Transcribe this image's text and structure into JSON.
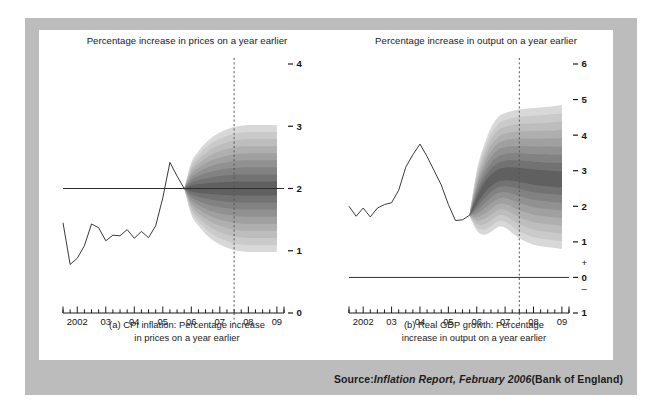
{
  "figure": {
    "background_color": "#ffffff",
    "frame_color": "#bcbcbc",
    "panel_color": "#ffffff",
    "ink_color": "#1a1a1a"
  },
  "source": {
    "prefix": "Source: ",
    "italic_part": "Inflation Report, February 2006",
    "suffix": " (Bank of England)"
  },
  "chart_data": [
    {
      "id": "cpi-inflation",
      "type": "area",
      "title": "Percentage increase in prices on a year earlier",
      "caption_line1": "(a)  CPI inflation: Percentage increase",
      "caption_line2": "in prices on a year earlier",
      "xlabel": "",
      "ylabel": "",
      "ylim": [
        0,
        4
      ],
      "yticks": [
        0,
        1,
        2,
        3,
        4
      ],
      "ytick_labels": [
        "0",
        "1",
        "2",
        "3",
        "4"
      ],
      "xlim": [
        2001.5,
        2009.25
      ],
      "xticks": [
        2002,
        2003,
        2004,
        2005,
        2006,
        2007,
        2008,
        2009
      ],
      "xtick_labels": [
        "2002",
        "03",
        "04",
        "05",
        "06",
        "07",
        "08",
        "09"
      ],
      "minor_tick_interval": 0.25,
      "grid": false,
      "target_line": {
        "value": 2.0,
        "label": "inflation target"
      },
      "forecast_start": 2005.75,
      "vertical_marker": {
        "x": 2007.5,
        "style": "dashed"
      },
      "history": {
        "x": [
          2001.5,
          2001.75,
          2002.0,
          2002.25,
          2002.5,
          2002.75,
          2003.0,
          2003.25,
          2003.5,
          2003.75,
          2004.0,
          2004.25,
          2004.5,
          2004.75,
          2005.0,
          2005.25,
          2005.5,
          2005.75
        ],
        "y": [
          1.45,
          0.78,
          0.88,
          1.08,
          1.43,
          1.37,
          1.16,
          1.25,
          1.24,
          1.34,
          1.2,
          1.31,
          1.21,
          1.4,
          1.85,
          2.42,
          2.2,
          2.0
        ]
      },
      "fan": {
        "center": {
          "x": [
            2005.75,
            2006.0,
            2006.25,
            2006.5,
            2006.75,
            2007.0,
            2007.25,
            2007.5,
            2007.75,
            2008.0,
            2008.25,
            2008.5,
            2008.75,
            2009.0
          ],
          "y": [
            2.0,
            2.0,
            2.0,
            2.0,
            2.0,
            2.0,
            2.0,
            2.0,
            2.0,
            2.0,
            2.0,
            2.0,
            2.0,
            2.0
          ]
        },
        "upper_outer": {
          "x": [
            2005.75,
            2006.0,
            2006.25,
            2006.5,
            2006.75,
            2007.0,
            2007.25,
            2007.5,
            2007.75,
            2008.0,
            2008.25,
            2008.5,
            2008.75,
            2009.0
          ],
          "y": [
            2.0,
            2.42,
            2.6,
            2.73,
            2.83,
            2.9,
            2.95,
            2.99,
            3.01,
            3.02,
            3.02,
            3.02,
            3.02,
            3.02
          ]
        },
        "lower_outer": {
          "x": [
            2005.75,
            2006.0,
            2006.25,
            2006.5,
            2006.75,
            2007.0,
            2007.25,
            2007.5,
            2007.75,
            2008.0,
            2008.25,
            2008.5,
            2008.75,
            2009.0
          ],
          "y": [
            2.0,
            1.58,
            1.4,
            1.27,
            1.17,
            1.1,
            1.05,
            1.01,
            0.99,
            0.98,
            0.98,
            0.98,
            0.98,
            0.98
          ]
        },
        "bands": 9,
        "shade_darkest": "#4a4a4a",
        "shade_lightest": "#d8d8d8"
      }
    },
    {
      "id": "real-gdp-growth",
      "type": "area",
      "title": "Percentage increase in output on a year earlier",
      "caption_line1": "(b)  Real GDP growth: Percentage",
      "caption_line2": "increase in output on a year earlier",
      "xlabel": "",
      "ylabel": "",
      "ylim": [
        -1,
        6
      ],
      "yticks": [
        -1,
        0,
        1,
        2,
        3,
        4,
        5,
        6
      ],
      "ytick_labels": [
        "1",
        "0",
        "1",
        "2",
        "3",
        "4",
        "5",
        "6"
      ],
      "sign_labels": {
        "plus": "+",
        "minus": "–"
      },
      "xlim": [
        2001.5,
        2009.25
      ],
      "xticks": [
        2002,
        2003,
        2004,
        2005,
        2006,
        2007,
        2008,
        2009
      ],
      "xtick_labels": [
        "2002",
        "03",
        "04",
        "05",
        "06",
        "07",
        "08",
        "09"
      ],
      "minor_tick_interval": 0.25,
      "grid": false,
      "zero_line": {
        "value": 0.0
      },
      "forecast_start": 2005.75,
      "vertical_marker": {
        "x": 2007.5,
        "style": "dashed"
      },
      "history": {
        "x": [
          2001.5,
          2001.75,
          2002.0,
          2002.25,
          2002.5,
          2002.75,
          2003.0,
          2003.25,
          2003.5,
          2003.75,
          2004.0,
          2004.25,
          2004.5,
          2004.75,
          2005.0,
          2005.25,
          2005.5,
          2005.75
        ],
        "y": [
          2.0,
          1.72,
          1.95,
          1.7,
          1.95,
          2.05,
          2.1,
          2.45,
          3.1,
          3.45,
          3.75,
          3.4,
          3.0,
          2.6,
          2.05,
          1.6,
          1.62,
          1.75
        ]
      },
      "fan": {
        "center": {
          "x": [
            2005.75,
            2006.0,
            2006.25,
            2006.5,
            2006.75,
            2007.0,
            2007.25,
            2007.5,
            2007.75,
            2008.0,
            2008.25,
            2008.5,
            2008.75,
            2009.0
          ],
          "y": [
            1.75,
            2.15,
            2.5,
            2.72,
            2.85,
            2.9,
            2.9,
            2.88,
            2.85,
            2.82,
            2.8,
            2.78,
            2.76,
            2.75
          ]
        },
        "upper_outer": {
          "x": [
            2005.75,
            2006.0,
            2006.25,
            2006.5,
            2006.75,
            2007.0,
            2007.25,
            2007.5,
            2007.75,
            2008.0,
            2008.25,
            2008.5,
            2008.75,
            2009.0
          ],
          "y": [
            1.78,
            3.0,
            3.7,
            4.2,
            4.5,
            4.62,
            4.68,
            4.72,
            4.74,
            4.76,
            4.78,
            4.8,
            4.82,
            4.85
          ]
        },
        "lower_outer": {
          "x": [
            2005.75,
            2006.0,
            2006.25,
            2006.5,
            2006.75,
            2007.0,
            2007.25,
            2007.5,
            2007.75,
            2008.0,
            2008.25,
            2008.5,
            2008.75,
            2009.0
          ],
          "y": [
            1.72,
            1.32,
            1.2,
            1.28,
            1.42,
            1.4,
            1.25,
            1.1,
            1.0,
            0.92,
            0.88,
            0.85,
            0.83,
            0.8
          ]
        },
        "bands": 9,
        "shade_darkest": "#4a4a4a",
        "shade_lightest": "#d8d8d8"
      }
    }
  ]
}
